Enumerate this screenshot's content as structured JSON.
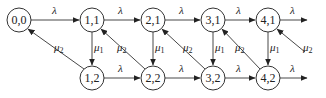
{
  "diagram": {
    "type": "state-transition-diagram",
    "nodes": [
      {
        "id": "n00",
        "label": "0,0",
        "x": 19,
        "y": 20
      },
      {
        "id": "n11",
        "label": "1,1",
        "x": 92,
        "y": 20
      },
      {
        "id": "n21",
        "label": "2,1",
        "x": 153,
        "y": 20
      },
      {
        "id": "n31",
        "label": "3,1",
        "x": 213,
        "y": 20
      },
      {
        "id": "n41",
        "label": "4,1",
        "x": 268,
        "y": 20
      },
      {
        "id": "n12",
        "label": "1,2",
        "x": 92,
        "y": 78
      },
      {
        "id": "n22",
        "label": "2,2",
        "x": 153,
        "y": 78
      },
      {
        "id": "n32",
        "label": "3,2",
        "x": 213,
        "y": 78
      },
      {
        "id": "n42",
        "label": "4,2",
        "x": 268,
        "y": 78
      }
    ],
    "labels": {
      "lambda": "λ",
      "mu": "μ",
      "mu1_sub": "1",
      "mu2_sub": "2"
    },
    "edges": [
      {
        "from": "0,0",
        "to": "1,1",
        "label": "λ"
      },
      {
        "from": "1,1",
        "to": "2,1",
        "label": "λ"
      },
      {
        "from": "2,1",
        "to": "3,1",
        "label": "λ"
      },
      {
        "from": "3,1",
        "to": "4,1",
        "label": "λ"
      },
      {
        "from": "4,1",
        "to": "out",
        "label": "λ"
      },
      {
        "from": "1,2",
        "to": "2,2",
        "label": "λ"
      },
      {
        "from": "2,2",
        "to": "3,2",
        "label": "λ"
      },
      {
        "from": "3,2",
        "to": "4,2",
        "label": "λ"
      },
      {
        "from": "4,2",
        "to": "out",
        "label": "λ"
      },
      {
        "from": "1,1",
        "to": "1,2",
        "label": "μ1"
      },
      {
        "from": "2,1",
        "to": "2,2",
        "label": "μ1"
      },
      {
        "from": "3,1",
        "to": "3,2",
        "label": "μ1"
      },
      {
        "from": "4,1",
        "to": "4,2",
        "label": "μ1"
      },
      {
        "from": "1,2",
        "to": "0,0",
        "label": "μ2"
      },
      {
        "from": "2,2",
        "to": "1,1",
        "label": "μ2"
      },
      {
        "from": "3,2",
        "to": "2,1",
        "label": "μ2"
      },
      {
        "from": "4,2",
        "to": "3,1",
        "label": "μ2"
      },
      {
        "from": "in",
        "to": "4,1",
        "label": "μ2"
      }
    ]
  }
}
